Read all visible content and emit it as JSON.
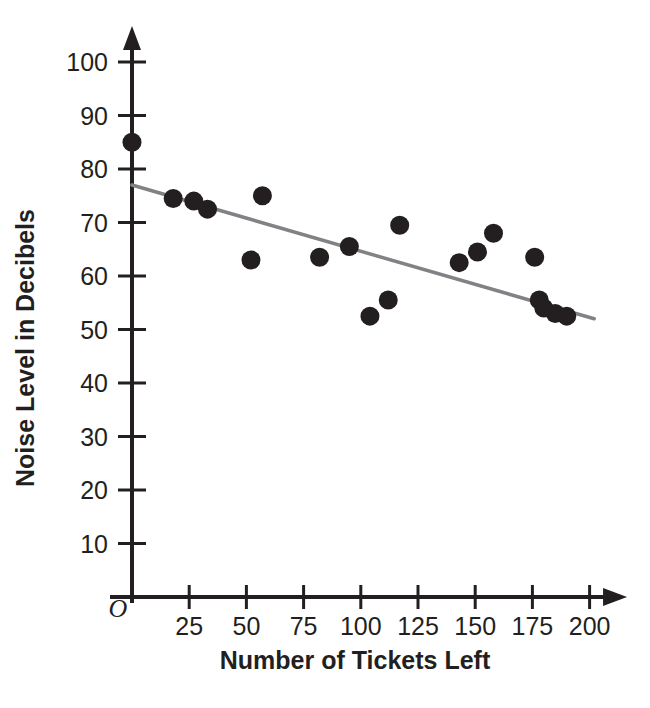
{
  "chart_data": {
    "type": "scatter",
    "title": "",
    "xlabel": "Number of Tickets Left",
    "ylabel": "Noise Level in Decibels",
    "xlim": [
      0,
      205
    ],
    "ylim": [
      0,
      103
    ],
    "xticks": [
      "25",
      "50",
      "75",
      "100",
      "125",
      "150",
      "175",
      "200"
    ],
    "xtick_values": [
      25,
      50,
      75,
      100,
      125,
      150,
      175,
      200
    ],
    "yticks": [
      "10",
      "20",
      "30",
      "40",
      "50",
      "60",
      "70",
      "80",
      "90",
      "100"
    ],
    "ytick_values": [
      10,
      20,
      30,
      40,
      50,
      60,
      70,
      80,
      90,
      100
    ],
    "origin_label": "O",
    "grid": false,
    "legend": false,
    "point_color": "#231f20",
    "trendline_color": "#808285",
    "axis_color": "#231f20",
    "points": [
      {
        "x": 0,
        "y": 85
      },
      {
        "x": 18,
        "y": 74.5
      },
      {
        "x": 27,
        "y": 74
      },
      {
        "x": 33,
        "y": 72.5
      },
      {
        "x": 52,
        "y": 63
      },
      {
        "x": 57,
        "y": 75
      },
      {
        "x": 82,
        "y": 63.5
      },
      {
        "x": 95,
        "y": 65.5
      },
      {
        "x": 104,
        "y": 52.5
      },
      {
        "x": 112,
        "y": 55.5
      },
      {
        "x": 117,
        "y": 69.5
      },
      {
        "x": 143,
        "y": 62.5
      },
      {
        "x": 151,
        "y": 64.5
      },
      {
        "x": 158,
        "y": 68
      },
      {
        "x": 176,
        "y": 63.5
      },
      {
        "x": 178,
        "y": 55.5
      },
      {
        "x": 180,
        "y": 54
      },
      {
        "x": 185,
        "y": 53
      },
      {
        "x": 190,
        "y": 52.5
      }
    ],
    "trendline": {
      "x0": 0,
      "y0": 77,
      "x1": 202,
      "y1": 52
    }
  }
}
